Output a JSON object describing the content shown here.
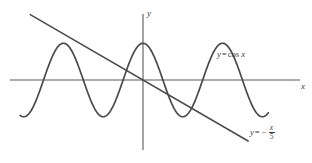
{
  "figure": {
    "background_color": "#ffffff",
    "stroke_color": "#4a4a4a",
    "axis_color": "#5a5a5a"
  },
  "axes": {
    "x_axis_label": "x",
    "y_axis_label": "y",
    "origin_px": {
      "x": 143,
      "y": 80
    },
    "x_axis_span_px": [
      10,
      300
    ],
    "y_axis_span_px": [
      14,
      150
    ]
  },
  "annotations": {
    "cosine_label": {
      "text": "y = cos x",
      "var_y": "y",
      "equals": "=",
      "func": "cos",
      "var_x": "x"
    },
    "line_label": {
      "text": "y = - x/5",
      "var_y": "y",
      "equals": "=",
      "minus": "−",
      "numerator": "x",
      "denominator": "5"
    }
  },
  "chart_data": {
    "type": "line",
    "xlabel": "x",
    "ylabel": "y",
    "grid": false,
    "legend_position": "inline-annotations",
    "xlim": [
      -10.5,
      12.4
    ],
    "ylim": [
      -1.85,
      1.85
    ],
    "axis_arrows": false,
    "series": [
      {
        "name": "y = cos x",
        "type": "cosine",
        "formula": "y = cos(x)",
        "amplitude": 1,
        "period": 6.283185,
        "phase": 0,
        "x_domain": [
          -9.7,
          9.9
        ],
        "label": "y = cos x",
        "label_position_px": {
          "x": 217,
          "y": 50
        },
        "color": "#4a4a4a",
        "key_points": [
          {
            "x": -6.2832,
            "y": 1
          },
          {
            "x": -3.1416,
            "y": -1
          },
          {
            "x": 0,
            "y": 1
          },
          {
            "x": 3.1416,
            "y": -1
          },
          {
            "x": 6.2832,
            "y": 1
          }
        ]
      },
      {
        "name": "y = -x/5",
        "type": "straight-line",
        "formula": "y = -x/5",
        "slope": -0.2,
        "intercept": 0,
        "x_domain": [
          -8.9,
          8.3
        ],
        "label": "y = - x/5",
        "label_position_px": {
          "x": 250,
          "y": 124
        },
        "color": "#4a4a4a",
        "key_points": [
          {
            "x": -8.9,
            "y": 1.78
          },
          {
            "x": 0,
            "y": 0
          },
          {
            "x": 8.3,
            "y": -1.66
          }
        ]
      }
    ],
    "intersections_approx": [
      {
        "x": -3.6,
        "y": 0.72
      },
      {
        "x": -2.7,
        "y": 0.54
      },
      {
        "x": 0.2,
        "y": 0.98
      },
      {
        "x": 2.6,
        "y": -0.52
      },
      {
        "x": 3.9,
        "y": -0.78
      }
    ]
  }
}
